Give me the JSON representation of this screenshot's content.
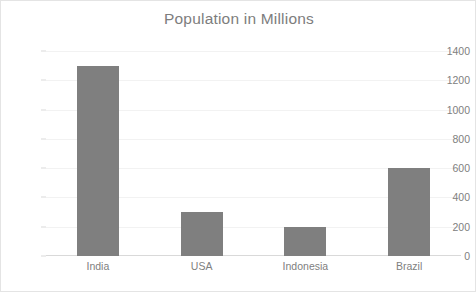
{
  "chart_data": {
    "type": "bar",
    "title": "Population in Millions",
    "categories": [
      "India",
      "USA",
      "Indonesia",
      "Brazil"
    ],
    "values": [
      1300,
      300,
      200,
      600
    ],
    "xlabel": "",
    "ylabel": "",
    "ylim": [
      0,
      1400
    ],
    "ytick_values": [
      0,
      200,
      400,
      600,
      800,
      1000,
      1200,
      1400
    ],
    "ytick_labels": [
      "0",
      "200",
      "400",
      "600",
      "800",
      "1000",
      "1200",
      "1400"
    ],
    "grid": true,
    "legend": false,
    "series": [
      {
        "name": "Population in Millions",
        "values": [
          1300,
          300,
          200,
          600
        ],
        "color": "#7f7f7f"
      }
    ]
  },
  "style": {
    "bar_color": "#7f7f7f",
    "text_color": "#808080",
    "title_color": "#7d7d7d",
    "gridline_color": "#f2f2f2",
    "axis_color": "#d9d9d9",
    "frame_border_color": "#e4e4e4",
    "background": "#ffffff"
  }
}
